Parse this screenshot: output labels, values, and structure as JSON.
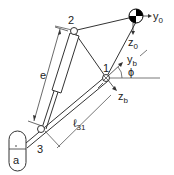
{
  "diagram": {
    "type": "mechanism-kinematic-sketch",
    "colors": {
      "line": "#333333",
      "thin_line": "#555555",
      "background": "#ffffff",
      "cog_fill": "#000000"
    },
    "joints": [
      {
        "id": "1",
        "label": "1"
      },
      {
        "id": "2",
        "label": "2"
      },
      {
        "id": "3",
        "label": "3"
      }
    ],
    "labels": {
      "joint1": "1",
      "joint2": "2",
      "joint3": "3",
      "cylinder_length": "e",
      "link_length_main": "ℓ",
      "link_length_sub": "31",
      "base_block": "a",
      "axis_y0_main": "y",
      "axis_y0_sub": "0",
      "axis_z0_main": "z",
      "axis_z0_sub": "0",
      "axis_yb_main": "y",
      "axis_yb_sub": "b",
      "axis_zb_main": "z",
      "axis_zb_sub": "b",
      "angle": "ϕ"
    },
    "icons": {
      "center_of_gravity": "cog-symbol-icon",
      "pivot": "pivot-circle-icon"
    }
  }
}
